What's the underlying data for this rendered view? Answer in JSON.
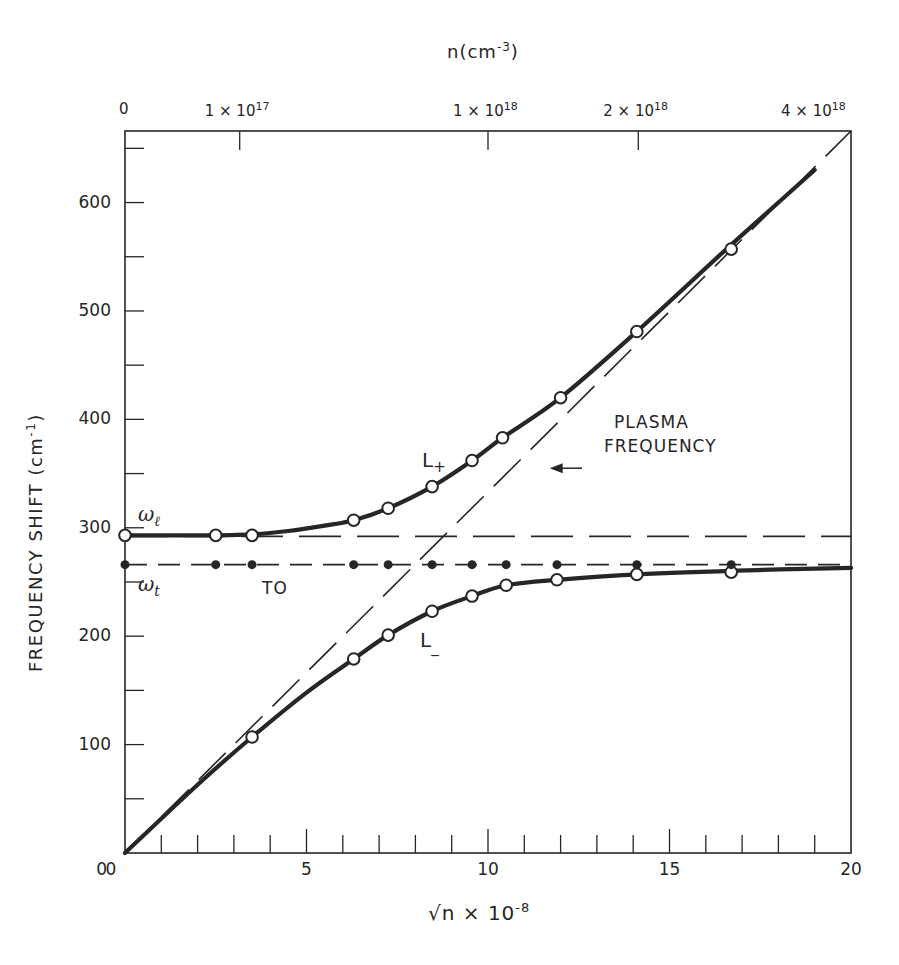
{
  "chart_data": {
    "type": "line",
    "title": "",
    "xlabel": "√n × 10^-8",
    "xlabel_parts": {
      "root": "√n",
      "times": " × 10",
      "exp": "-8"
    },
    "ylabel": "FREQUENCY SHIFT (cm^-1)",
    "ylabel_parts": {
      "text": "FREQUENCY SHIFT (cm",
      "exp": "-1",
      "close": ")"
    },
    "top_xlabel": "n(cm^-3)",
    "top_xlabel_parts": {
      "text": "n(cm",
      "exp": "-3",
      "close": ")"
    },
    "xlim": [
      0,
      20
    ],
    "ylim": [
      0,
      666
    ],
    "grid": false,
    "legend": "none (inline labels)",
    "x_ticks": [
      0,
      5,
      10,
      15,
      20
    ],
    "x_tick_labels": [
      "0",
      "5",
      "10",
      "15",
      "20"
    ],
    "x_minor_step": 1,
    "y_ticks": [
      100,
      200,
      300,
      400,
      500,
      600
    ],
    "y_tick_labels": [
      "100",
      "200",
      "300",
      "400",
      "500",
      "600"
    ],
    "y_origin_label": "0",
    "y_minor_step": 50,
    "top_ticks": [
      {
        "label": "0",
        "mantissa": "0",
        "exp": "",
        "x": 0
      },
      {
        "label": "1×10^17",
        "mantissa": "1 × 10",
        "exp": "17",
        "x": 3.16
      },
      {
        "label": "1×10^18",
        "mantissa": "1 × 10",
        "exp": "18",
        "x": 10.0
      },
      {
        "label": "2×10^18",
        "mantissa": "2 × 10",
        "exp": "18",
        "x": 14.14
      },
      {
        "label": "4×10^18",
        "mantissa": "4 × 10",
        "exp": "18",
        "x": 20.0
      }
    ],
    "series": [
      {
        "name": "L+",
        "style": "solid-thick",
        "marker": "open-circle",
        "curve_x": [
          0,
          2,
          3.5,
          4.5,
          5.5,
          6.3,
          7.25,
          8.46,
          9.56,
          10.4,
          12,
          14.1,
          16.5,
          18,
          19
        ],
        "curve_y": [
          293,
          293,
          294,
          297,
          302,
          307,
          318,
          338,
          362,
          383,
          420,
          481,
          555,
          600,
          630
        ],
        "points_x": [
          0,
          2.5,
          3.5,
          6.3,
          7.25,
          8.46,
          9.56,
          10.4,
          12.0,
          14.1,
          16.7
        ],
        "points_y": [
          293,
          293,
          293,
          307,
          318,
          338,
          362,
          383,
          420,
          481,
          557
        ]
      },
      {
        "name": "L-",
        "style": "solid-thick",
        "marker": "open-circle",
        "curve_x": [
          0,
          2,
          3.5,
          5,
          6.3,
          7.25,
          8.46,
          9.56,
          10.5,
          11.9,
          14.1,
          17.4,
          20
        ],
        "curve_y": [
          0,
          63,
          107,
          148,
          179,
          201,
          223,
          237,
          247,
          252,
          257,
          261,
          263
        ],
        "points_x": [
          3.5,
          6.3,
          7.25,
          8.46,
          9.56,
          10.5,
          11.9,
          14.1,
          16.7
        ],
        "points_y": [
          107,
          179,
          201,
          223,
          237,
          247,
          252,
          257,
          259
        ]
      },
      {
        "name": "TO (ω_t)",
        "style": "dash",
        "marker": "filled-circle",
        "line_y": 266,
        "points_x": [
          0,
          2.5,
          3.5,
          6.3,
          7.25,
          8.46,
          9.56,
          10.5,
          11.9,
          14.1,
          16.7
        ],
        "points_y": [
          266,
          266,
          266,
          266,
          266,
          266,
          266,
          266,
          266,
          266,
          266
        ]
      },
      {
        "name": "ω_l",
        "style": "long-dash",
        "line_y": 292
      },
      {
        "name": "Plasma frequency",
        "style": "long-dash",
        "x": [
          0,
          20
        ],
        "y": [
          0,
          666
        ]
      }
    ],
    "annotations": [
      {
        "text": "ω_l",
        "x": 0.4,
        "y": 310
      },
      {
        "text": "ω_t",
        "x": 0.4,
        "y": 250
      },
      {
        "text": "TO",
        "x": 3.9,
        "y": 250
      },
      {
        "text": "L+",
        "x": 8.1,
        "y": 370
      },
      {
        "text": "L-",
        "x": 8.1,
        "y": 190
      },
      {
        "text": "PLASMA FREQUENCY",
        "x": 12.7,
        "y": 390,
        "arrow_to_x": 11.7
      }
    ]
  },
  "labels": {
    "omega_l": "ω",
    "omega_l_sub": "ℓ",
    "omega_t": "ω",
    "omega_t_sub": "t",
    "to": "TO",
    "lplus": "L",
    "lplus_sub": "+",
    "lminus": "L",
    "lminus_sub": "_",
    "plasma_line1": "PLASMA",
    "plasma_line2": "FREQUENCY"
  }
}
